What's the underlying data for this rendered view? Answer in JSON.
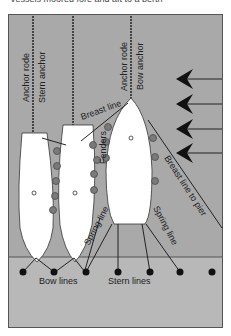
{
  "caption": "Vessels moored fore and aft to a berth",
  "colors": {
    "water": "#a9a9a9",
    "pier": "#b8b8b8",
    "hull": "#ffffff",
    "line": "#222222"
  },
  "labels": {
    "anchor_rode_left": "Anchor rode",
    "stern_anchor": "Stern anchor",
    "anchor_rode_right": "Anchor rode",
    "bow_anchor": "Bow anchor",
    "breast_line": "Breast line",
    "fenders": "Fenders",
    "breast_line_to_pier": "Breast line to pier",
    "spring_line_left": "Spring line",
    "spring_line_right": "Spring line",
    "bow_lines": "Bow lines",
    "stern_lines": "Stern lines"
  },
  "icons": {
    "wind_arrows": "wind-direction-arrows",
    "bollards": "bollard-dots",
    "fenders": "fender-circles"
  }
}
